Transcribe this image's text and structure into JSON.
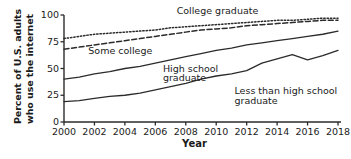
{
  "chart_data": {
    "type": "line",
    "title": "",
    "xlabel": "Year",
    "ylabel_line1": "Percent of U.S. adults",
    "ylabel_line2": "who use the internet",
    "xlim": [
      2000,
      2018
    ],
    "ylim": [
      0,
      100
    ],
    "yticks": [
      0,
      25,
      50,
      75,
      100
    ],
    "xticks": [
      2000,
      2002,
      2004,
      2006,
      2008,
      2010,
      2012,
      2014,
      2016,
      2018
    ],
    "grid": false,
    "legend": "inline-annotations",
    "x": [
      2000,
      2001,
      2002,
      2003,
      2004,
      2005,
      2006,
      2007,
      2008,
      2009,
      2010,
      2011,
      2012,
      2013,
      2014,
      2015,
      2016,
      2017,
      2018
    ],
    "series": [
      {
        "name": "College graduate",
        "style": "dotted",
        "color": "#2b2b2b",
        "label": "College graduate",
        "values": [
          78,
          80,
          82,
          83,
          84,
          85,
          86,
          88,
          89,
          90,
          91,
          92,
          93,
          94,
          95,
          95,
          96,
          97,
          97
        ]
      },
      {
        "name": "Some college",
        "style": "dashed",
        "color": "#2b2b2b",
        "label": "Some college",
        "values": [
          68,
          70,
          72,
          74,
          76,
          78,
          80,
          82,
          84,
          86,
          87,
          88,
          90,
          91,
          92,
          93,
          94,
          95,
          95
        ]
      },
      {
        "name": "High school graduate",
        "style": "solid",
        "color": "#2b2b2b",
        "label": "High school graduate",
        "values": [
          40,
          42,
          45,
          47,
          50,
          52,
          55,
          58,
          61,
          64,
          67,
          69,
          72,
          74,
          76,
          78,
          80,
          82,
          85
        ]
      },
      {
        "name": "Less than high school graduate",
        "style": "solid",
        "color": "#2b2b2b",
        "label": "Less than high school graduate",
        "values": [
          19,
          20,
          22,
          24,
          25,
          27,
          30,
          33,
          36,
          40,
          43,
          45,
          48,
          55,
          59,
          63,
          58,
          62,
          67
        ]
      }
    ],
    "annotations": [
      {
        "text": "College graduate",
        "x": 2007.4,
        "y": 101
      },
      {
        "text": "Some college",
        "x": 2001.6,
        "y": 64
      },
      {
        "text": "High school",
        "x": 2006.5,
        "y": 47
      },
      {
        "text": "graduate",
        "x": 2006.5,
        "y": 38
      },
      {
        "text": "Less than high school",
        "x": 2011.2,
        "y": 26
      },
      {
        "text": "graduate",
        "x": 2011.2,
        "y": 17
      }
    ]
  }
}
